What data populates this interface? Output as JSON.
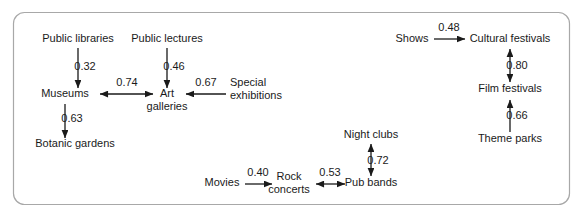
{
  "figure": {
    "kind": "path-diagram",
    "border_color": "#a8a8a8",
    "line_color": "#1a1a1a",
    "background": "#ffffff"
  },
  "chart_data": {
    "type": "diagram",
    "title": "",
    "nodes": [
      {
        "id": "public_libraries",
        "label": "Public libraries",
        "x": 78,
        "y": 42,
        "anchor": "middle"
      },
      {
        "id": "public_lectures",
        "label": "Public lectures",
        "x": 167,
        "y": 42,
        "anchor": "middle"
      },
      {
        "id": "museums",
        "label": "Museums",
        "x": 65,
        "y": 97,
        "anchor": "middle"
      },
      {
        "id": "art_galleries_1",
        "label": "Art",
        "x": 167,
        "y": 97,
        "anchor": "middle"
      },
      {
        "id": "art_galleries_2",
        "label": "galleries",
        "x": 167,
        "y": 110,
        "anchor": "middle"
      },
      {
        "id": "special_exh_1",
        "label": "Special",
        "x": 230,
        "y": 86,
        "anchor": "start"
      },
      {
        "id": "special_exh_2",
        "label": "exhibitions",
        "x": 230,
        "y": 99,
        "anchor": "start"
      },
      {
        "id": "botanic_gardens",
        "label": "Botanic gardens",
        "x": 75,
        "y": 147,
        "anchor": "middle"
      },
      {
        "id": "movies",
        "label": "Movies",
        "x": 222,
        "y": 186,
        "anchor": "middle"
      },
      {
        "id": "rock_concerts_1",
        "label": "Rock",
        "x": 289,
        "y": 180,
        "anchor": "middle"
      },
      {
        "id": "rock_concerts_2",
        "label": "concerts",
        "x": 289,
        "y": 193,
        "anchor": "middle"
      },
      {
        "id": "pub_bands",
        "label": "Pub bands",
        "x": 371,
        "y": 186,
        "anchor": "middle"
      },
      {
        "id": "night_clubs",
        "label": "Night clubs",
        "x": 371,
        "y": 138,
        "anchor": "middle"
      },
      {
        "id": "shows",
        "label": "Shows",
        "x": 412,
        "y": 42,
        "anchor": "middle"
      },
      {
        "id": "cultural_festivals",
        "label": "Cultural festivals",
        "x": 510,
        "y": 42,
        "anchor": "middle"
      },
      {
        "id": "film_festivals",
        "label": "Film festivals",
        "x": 510,
        "y": 92,
        "anchor": "middle"
      },
      {
        "id": "theme_parks",
        "label": "Theme parks",
        "x": 510,
        "y": 142,
        "anchor": "middle"
      }
    ],
    "edges": [
      {
        "id": "e1",
        "from": "public_libraries",
        "to": "museums",
        "weight": "0.32",
        "direction": "one-way",
        "x1": 78,
        "y1": 48,
        "x2": 78,
        "y2": 88,
        "label_x": 85,
        "label_y": 70
      },
      {
        "id": "e2",
        "from": "public_lectures",
        "to": "art_galleries",
        "weight": "0.46",
        "direction": "one-way",
        "x1": 167,
        "y1": 48,
        "x2": 167,
        "y2": 88,
        "label_x": 174,
        "label_y": 70
      },
      {
        "id": "e3",
        "from": "museums",
        "to": "art_galleries",
        "weight": "0.74",
        "direction": "two-way",
        "x1": 100,
        "y1": 94,
        "x2": 153,
        "y2": 94,
        "label_x": 127,
        "label_y": 86
      },
      {
        "id": "e4",
        "from": "special_exhibitions",
        "to": "art_galleries",
        "weight": "0.67",
        "direction": "one-way",
        "x1": 226,
        "y1": 94,
        "x2": 186,
        "y2": 94,
        "label_x": 206,
        "label_y": 86
      },
      {
        "id": "e5",
        "from": "museums",
        "to": "botanic_gardens",
        "weight": "0.63",
        "direction": "one-way",
        "x1": 65,
        "y1": 104,
        "x2": 65,
        "y2": 138,
        "label_x": 72,
        "label_y": 122
      },
      {
        "id": "e6",
        "from": "movies",
        "to": "rock_concerts",
        "weight": "0.40",
        "direction": "one-way",
        "x1": 245,
        "y1": 184,
        "x2": 272,
        "y2": 184,
        "label_x": 258,
        "label_y": 176
      },
      {
        "id": "e7",
        "from": "rock_concerts",
        "to": "pub_bands",
        "weight": "0.53",
        "direction": "two-way",
        "x1": 316,
        "y1": 184,
        "x2": 345,
        "y2": 184,
        "label_x": 330,
        "label_y": 176
      },
      {
        "id": "e8",
        "from": "night_clubs",
        "to": "pub_bands",
        "weight": "0.72",
        "direction": "two-way",
        "x1": 371,
        "y1": 144,
        "x2": 371,
        "y2": 176,
        "label_x": 378,
        "label_y": 164
      },
      {
        "id": "e9",
        "from": "shows",
        "to": "cultural_festivals",
        "weight": "0.48",
        "direction": "one-way",
        "x1": 434,
        "y1": 39,
        "x2": 465,
        "y2": 39,
        "label_x": 449,
        "label_y": 31
      },
      {
        "id": "e10",
        "from": "cultural_festivals",
        "to": "film_festivals",
        "weight": "0.80",
        "direction": "two-way",
        "x1": 510,
        "y1": 49,
        "x2": 510,
        "y2": 82,
        "label_x": 517,
        "label_y": 69
      },
      {
        "id": "e11",
        "from": "theme_parks",
        "to": "film_festivals",
        "weight": "0.66",
        "direction": "one-way",
        "x1": 510,
        "y1": 132,
        "x2": 510,
        "y2": 100,
        "label_x": 517,
        "label_y": 119
      }
    ]
  }
}
